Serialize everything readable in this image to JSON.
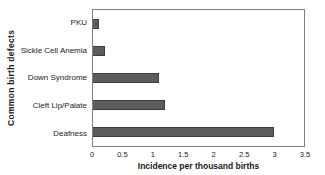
{
  "chart_data": {
    "type": "bar",
    "orientation": "horizontal",
    "categories": [
      "PKU",
      "Sickle Cell Anemia",
      "Down Syndrome",
      "Cleft Lip/Palate",
      "Deafness"
    ],
    "values": [
      0.1,
      0.2,
      1.1,
      1.2,
      3.0
    ],
    "xlabel": "Incidence per thousand births",
    "ylabel": "Common birth defects",
    "xlim": [
      0,
      3.5
    ],
    "xticks": [
      "0",
      "0.5",
      "1",
      "1.5",
      "2",
      "2.5",
      "3",
      "3.5"
    ],
    "xtick_values": [
      0,
      0.5,
      1,
      1.5,
      2,
      2.5,
      3,
      3.5
    ],
    "grid": false,
    "legend": false,
    "bar_color": "#5c5c5c",
    "bar_border_color": "#3d3d3d",
    "frame_color": "#808080",
    "background_color": "#ffffff"
  }
}
